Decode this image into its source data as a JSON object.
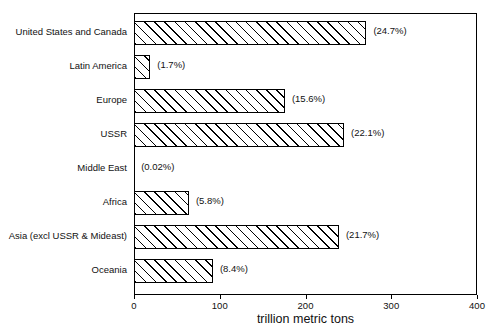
{
  "chart_data": {
    "type": "bar",
    "orientation": "horizontal",
    "title": "",
    "subtitle": "",
    "xlabel": "trillion metric tons",
    "ylabel": "",
    "xlim": [
      0,
      400
    ],
    "xticks": [
      0,
      100,
      200,
      300,
      400
    ],
    "xtick_labels": [
      "0",
      "100",
      "200",
      "300",
      "400"
    ],
    "grid": false,
    "legend": null,
    "bar_style": "diagonal-hatch",
    "categories": [
      "United States and Canada",
      "Latin America",
      "Europe",
      "USSR",
      "Middle East",
      "Africa",
      "Asia (excl USSR & Mideast)",
      "Oceania"
    ],
    "values": [
      271,
      19,
      176,
      245,
      0.2,
      64,
      239,
      92
    ],
    "annotations": [
      "(24.7%)",
      "(1.7%)",
      "(15.6%)",
      "(22.1%)",
      "(0.02%)",
      "(5.8%)",
      "(21.7%)",
      "(8.4%)"
    ],
    "series": [
      {
        "name": "Coal reserves",
        "values": [
          271,
          19,
          176,
          245,
          0.2,
          64,
          239,
          92
        ]
      }
    ]
  },
  "axis": {
    "x_title": "trillion metric tons"
  },
  "colors": {
    "axis": "#000000",
    "bar_fill": "#ffffff",
    "bar_hatch": "#000000",
    "text": "#111111",
    "background": "#ffffff"
  }
}
